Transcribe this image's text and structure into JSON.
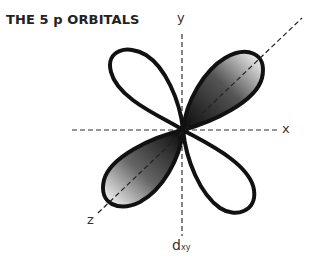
{
  "title": "THE 5 p ORBITALS",
  "axes": {
    "x_label": "x",
    "y_label": "y",
    "z_label": "z"
  },
  "orbital": {
    "name_main": "d",
    "name_sub": "xy",
    "lobes": [
      {
        "position": "upper-left",
        "phase": "unshaded"
      },
      {
        "position": "upper-right",
        "phase": "shaded"
      },
      {
        "position": "lower-left",
        "phase": "shaded"
      },
      {
        "position": "lower-right",
        "phase": "unshaded"
      }
    ]
  },
  "colors": {
    "outline": "#111111",
    "shade_dark": "#1a1a1a",
    "shade_light": "#ffffff",
    "axis": "#333333"
  }
}
